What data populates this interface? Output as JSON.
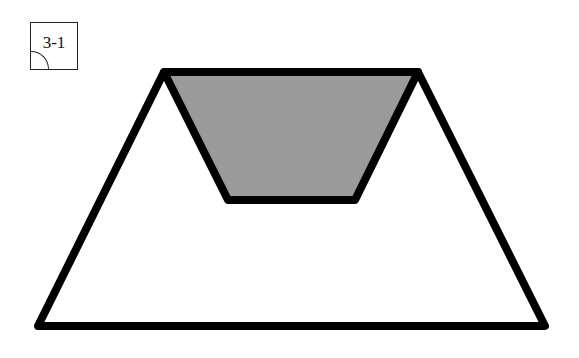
{
  "label": {
    "text": "3-1"
  },
  "figure": {
    "outer_trapezoid": {
      "points": [
        [
          164,
          72
        ],
        [
          418,
          72
        ],
        [
          545,
          326
        ],
        [
          38,
          326
        ]
      ],
      "fill": "#ffffff",
      "stroke": "#000000",
      "stroke_width": 8
    },
    "inner_trapezoid": {
      "points": [
        [
          164,
          72
        ],
        [
          418,
          72
        ],
        [
          355,
          200
        ],
        [
          228,
          200
        ]
      ],
      "fill": "#9a9a9a",
      "stroke": "#000000",
      "stroke_width": 8
    }
  }
}
